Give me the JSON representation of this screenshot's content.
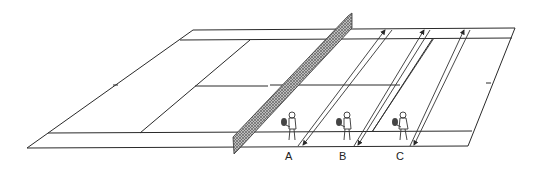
{
  "diagram": {
    "colors": {
      "ink": "#2a2a2a",
      "background": "#ffffff",
      "net": "#555555"
    },
    "players": [
      {
        "id": "A",
        "label": "A",
        "x": 292,
        "y": 130
      },
      {
        "id": "B",
        "label": "B",
        "x": 346,
        "y": 130
      },
      {
        "id": "C",
        "label": "C",
        "x": 402,
        "y": 130
      }
    ],
    "shot_arrows": [
      {
        "player": "A",
        "from": [
          300,
          147
        ],
        "to": [
          387,
          29
        ]
      },
      {
        "player": "B",
        "from": [
          356,
          147
        ],
        "to": [
          426,
          29
        ]
      },
      {
        "player": "C",
        "from": [
          410,
          147
        ],
        "to": [
          466,
          29
        ]
      }
    ]
  }
}
